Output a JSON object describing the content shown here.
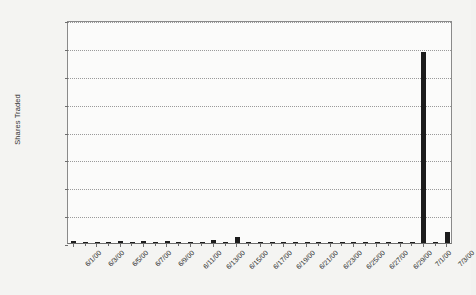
{
  "chart_data": {
    "type": "bar",
    "title": "",
    "subtitle": "",
    "xlabel": "",
    "ylabel": "Shares Traded",
    "ylim": [
      0,
      400000
    ],
    "ytick_values": [
      0,
      50000,
      100000,
      150000,
      200000,
      250000,
      300000,
      350000,
      400000
    ],
    "ytick_labels": [
      "0",
      "50,000",
      "100,000",
      "150,000",
      "200,000",
      "250,000",
      "300,000",
      "350,000",
      "400,000"
    ],
    "grid": true,
    "grid_axis": "y",
    "grid_style": "dotted",
    "legend": false,
    "legend_position": "none",
    "bar_color": "#1c1c1c",
    "plot_background": "#fbfbfa",
    "figure_background": "#f4f4f2",
    "axis_color": "#6e6e6e",
    "categories": [
      "6/1/00",
      "6/2/00",
      "6/3/00",
      "6/4/00",
      "6/5/00",
      "6/6/00",
      "6/7/00",
      "6/8/00",
      "6/9/00",
      "6/10/00",
      "6/11/00",
      "6/12/00",
      "6/13/00",
      "6/14/00",
      "6/15/00",
      "6/16/00",
      "6/17/00",
      "6/18/00",
      "6/19/00",
      "6/20/00",
      "6/21/00",
      "6/22/00",
      "6/23/00",
      "6/24/00",
      "6/25/00",
      "6/26/00",
      "6/27/00",
      "6/28/00",
      "6/29/00",
      "6/30/00",
      "7/1/00",
      "7/2/00",
      "7/3/00"
    ],
    "xtick_labels": [
      "6/1/00",
      "6/3/00",
      "6/5/00",
      "6/7/00",
      "6/9/00",
      "6/11/00",
      "6/13/00",
      "6/15/00",
      "6/17/00",
      "6/19/00",
      "6/21/00",
      "6/23/00",
      "6/25/00",
      "6/27/00",
      "6/29/00",
      "7/1/00",
      "7/3/00"
    ],
    "xtick_indices": [
      0,
      2,
      4,
      6,
      8,
      10,
      12,
      14,
      16,
      18,
      20,
      22,
      24,
      26,
      28,
      30,
      32
    ],
    "values": [
      2800,
      600,
      500,
      400,
      2900,
      400,
      3000,
      500,
      3600,
      400,
      500,
      400,
      6200,
      600,
      11500,
      2500,
      400,
      500,
      600,
      400,
      500,
      400,
      600,
      500,
      400,
      600,
      400,
      500,
      600,
      400,
      343000,
      500,
      19000
    ],
    "max_value": 343000,
    "max_value_label": "7/1/00",
    "units": "shares"
  }
}
